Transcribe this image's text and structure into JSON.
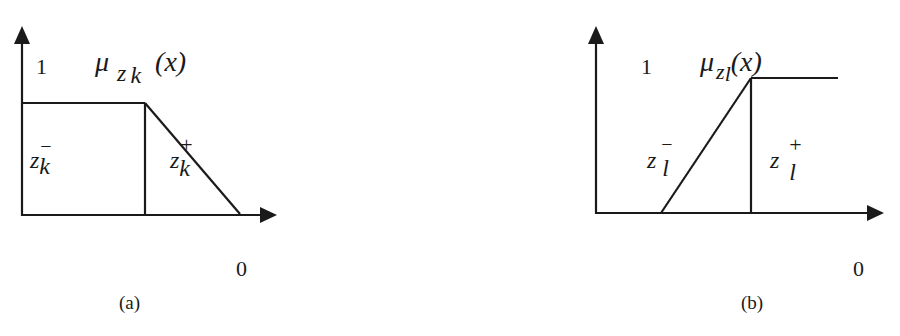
{
  "figure": {
    "panels": [
      {
        "id": "a",
        "caption": "(a)",
        "y_tick": "1",
        "x_tick": "0",
        "function_label": {
          "symbol": "μ",
          "sub1": "z",
          "sub2": "k",
          "arg": "(x)"
        },
        "region_left": {
          "base": "z",
          "sub": "k",
          "sup": "−"
        },
        "region_right": {
          "base": "z",
          "sub": "k",
          "sup": "+"
        },
        "shape": "decreasing (Z-shaped): plateau at 1 then linear decline to 0"
      },
      {
        "id": "b",
        "caption": "(b)",
        "y_tick": "1",
        "x_tick": "0",
        "function_label": {
          "symbol": "μ",
          "sub1": "z",
          "sub2": "l",
          "arg": "(x)"
        },
        "region_left": {
          "base": "z",
          "sub": "l",
          "sup": "−"
        },
        "region_right": {
          "base": "z",
          "sub": "l",
          "sup": "+"
        },
        "shape": "increasing (S-shaped): linear rise from 0 then plateau at 1"
      }
    ],
    "colors": {
      "line": "#1a1a1a",
      "background": "#ffffff"
    }
  }
}
